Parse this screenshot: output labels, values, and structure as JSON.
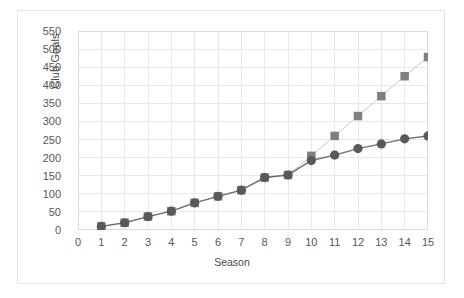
{
  "chart_data": {
    "type": "line",
    "title": "",
    "xlabel": "Season",
    "ylabel": "Club Goals",
    "x": [
      1,
      2,
      3,
      4,
      5,
      6,
      7,
      8,
      9,
      10,
      11,
      12,
      13,
      14,
      15
    ],
    "xlim": [
      0,
      15
    ],
    "ylim": [
      0,
      550
    ],
    "xticks": [
      "0",
      "1",
      "2",
      "3",
      "4",
      "5",
      "6",
      "7",
      "8",
      "9",
      "10",
      "11",
      "12",
      "13",
      "14",
      "15"
    ],
    "yticks": [
      "0",
      "50",
      "100",
      "150",
      "200",
      "250",
      "300",
      "350",
      "400",
      "450",
      "500",
      "550"
    ],
    "grid": true,
    "legend": "none",
    "series": [
      {
        "name": "series-squares",
        "marker": "square",
        "color": "#808080",
        "line_color": "#c9c9c9",
        "values": [
          10,
          20,
          37,
          52,
          75,
          93,
          110,
          145,
          152,
          205,
          260,
          315,
          370,
          425,
          478
        ]
      },
      {
        "name": "series-circles",
        "marker": "circle",
        "color": "#595959",
        "line_color": "#6e6e6e",
        "values": [
          10,
          20,
          37,
          52,
          75,
          93,
          110,
          145,
          152,
          192,
          207,
          225,
          238,
          252,
          260
        ]
      }
    ]
  },
  "axes": {
    "y_title": "Club Goals",
    "x_title": "Season"
  },
  "colors": {
    "grid": "#e8e8e8",
    "frame": "#e3e3e3",
    "tick_text": "#565656",
    "axis_title": "#4a4a4a"
  }
}
